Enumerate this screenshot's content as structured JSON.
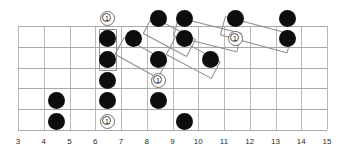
{
  "diagram": {
    "kind": "guitar-fretboard-diagram",
    "title": "",
    "strings": 6,
    "fret_start": 3,
    "fret_end": 15,
    "colors": {
      "note": "#0d0d0d",
      "grid": "#b9b9b9",
      "string": "#a9a9a9",
      "box": "#8d8d8d",
      "root_ring": "#6e6e6e",
      "label": "#2b2b2b",
      "background": "#ffffff"
    }
  },
  "fret_numbers": [
    "3",
    "4",
    "5",
    "6",
    "7",
    "8",
    "9",
    "10",
    "11",
    "12",
    "13",
    "14",
    "15"
  ],
  "notes": [
    {
      "id": "n1",
      "fret": 4,
      "string": 5,
      "x": 56,
      "y": 100
    },
    {
      "id": "n2",
      "fret": 4,
      "string": 6,
      "x": 56,
      "y": 121
    },
    {
      "id": "n3",
      "fret": 6,
      "string": 2,
      "x": 107,
      "y": 38
    },
    {
      "id": "n4",
      "fret": 6,
      "string": 3,
      "x": 107,
      "y": 59
    },
    {
      "id": "n5",
      "fret": 6,
      "string": 4,
      "x": 107,
      "y": 80
    },
    {
      "id": "n6",
      "fret": 6,
      "string": 5,
      "x": 107,
      "y": 100
    },
    {
      "id": "n7",
      "fret": 7,
      "string": 2,
      "x": 133,
      "y": 38
    },
    {
      "id": "n8",
      "fret": 8,
      "string": 1,
      "x": 158,
      "y": 18
    },
    {
      "id": "n9",
      "fret": 8,
      "string": 3,
      "x": 158,
      "y": 59
    },
    {
      "id": "n10",
      "fret": 8,
      "string": 5,
      "x": 158,
      "y": 100
    },
    {
      "id": "n11",
      "fret": 9,
      "string": 1,
      "x": 184,
      "y": 18
    },
    {
      "id": "n12",
      "fret": 9,
      "string": 2,
      "x": 184,
      "y": 38
    },
    {
      "id": "n13",
      "fret": 9,
      "string": 6,
      "x": 184,
      "y": 121
    },
    {
      "id": "n14",
      "fret": 10,
      "string": 3,
      "x": 210,
      "y": 59
    },
    {
      "id": "n15",
      "fret": 11,
      "string": 1,
      "x": 235,
      "y": 18
    },
    {
      "id": "n16",
      "fret": 13,
      "string": 1,
      "x": 287,
      "y": 18
    },
    {
      "id": "n17",
      "fret": 13,
      "string": 2,
      "x": 287,
      "y": 38
    }
  ],
  "root_markers": [
    {
      "id": "r1",
      "label": "1",
      "fret": 6,
      "string": 1,
      "x": 107,
      "y": 18
    },
    {
      "id": "r2",
      "label": "1",
      "fret": 6,
      "string": 6,
      "x": 107,
      "y": 121
    },
    {
      "id": "r3",
      "label": "1",
      "fret": 8,
      "string": 4,
      "x": 158,
      "y": 80
    },
    {
      "id": "r4",
      "label": "1",
      "fret": 11,
      "string": 2,
      "x": 235,
      "y": 38
    }
  ],
  "group_boxes": [
    {
      "id": "b1",
      "label": "vertical-pair-fret6",
      "x": 99,
      "y": 29,
      "w": 18,
      "h": 42,
      "rotate": 0
    },
    {
      "id": "b2",
      "label": "diagonal-fret7-8",
      "x": 124,
      "y": 37,
      "w": 50,
      "h": 20,
      "rotate": 29
    },
    {
      "id": "b3",
      "label": "diagonal-fret8-9",
      "x": 152,
      "y": 16,
      "w": 50,
      "h": 20,
      "rotate": 28
    },
    {
      "id": "b4",
      "label": "diagonal-fret9-10",
      "x": 175,
      "y": 37,
      "w": 52,
      "h": 20,
      "rotate": 28
    },
    {
      "id": "b5",
      "label": "diagonal-fret9-11",
      "x": 178,
      "y": 17,
      "w": 66,
      "h": 20,
      "rotate": 14
    },
    {
      "id": "b6",
      "label": "diagonal-fret11-13",
      "x": 225,
      "y": 16,
      "w": 70,
      "h": 20,
      "rotate": 15
    }
  ]
}
